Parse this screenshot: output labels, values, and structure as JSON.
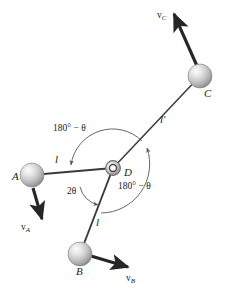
{
  "figure": {
    "width": 227,
    "height": 288,
    "background": "#ffffff",
    "line_color": "#3a3a3a",
    "arc_color": "#555555",
    "arrow_color": "#262626",
    "sphere_fill_light": "#f2f2f2",
    "sphere_fill_mid": "#c9c9c9",
    "sphere_fill_dark": "#8f8f8f",
    "sphere_stroke": "#7a7a7a"
  },
  "nodes": [
    {
      "id": "A",
      "label": "A",
      "cx": 32,
      "cy": 175,
      "r": 12,
      "label_x": 12,
      "label_y": 178,
      "type": "sphere"
    },
    {
      "id": "B",
      "label": "B",
      "cx": 80,
      "cy": 254,
      "r": 12,
      "label_x": 76,
      "label_y": 272,
      "type": "sphere"
    },
    {
      "id": "C",
      "label": "C",
      "cx": 200,
      "cy": 76,
      "r": 12,
      "label_x": 203,
      "label_y": 93,
      "type": "sphere"
    },
    {
      "id": "D",
      "label": "D",
      "cx": 113,
      "cy": 168,
      "r": 6,
      "label_x": 124,
      "label_y": 174,
      "type": "pivot-ring"
    }
  ],
  "rods": [
    {
      "id": "AD",
      "from": "A",
      "to": "D",
      "label": "l",
      "label_x": 56,
      "label_y": 160
    },
    {
      "id": "DB",
      "from": "D",
      "to": "B",
      "label": "l",
      "label_x": 96,
      "label_y": 222
    },
    {
      "id": "DC",
      "from": "D",
      "to": "C",
      "label": "l'",
      "label_x": 161,
      "label_y": 120
    }
  ],
  "velocity_vectors": [
    {
      "id": "vA",
      "symbol": "v",
      "subscript": "A",
      "label": "v_A",
      "x1": 33,
      "y1": 188,
      "x2": 42,
      "y2": 221,
      "label_x": 24,
      "label_y": 229
    },
    {
      "id": "vB",
      "symbol": "v",
      "subscript": "B",
      "label": "v_B",
      "x1": 92,
      "y1": 256,
      "x2": 130,
      "y2": 268,
      "label_x": 127,
      "label_y": 281
    },
    {
      "id": "vC",
      "symbol": "v",
      "subscript": "C",
      "label": "v_C",
      "x1": 196,
      "y1": 65,
      "x2": 172,
      "y2": 11,
      "label_x": 158,
      "label_y": 18
    }
  ],
  "angle_annotations": [
    {
      "id": "angle-upper-left",
      "prefix": "180°",
      "operator": " − ",
      "theta": "θ",
      "text": "180° − θ",
      "label_x": 54,
      "label_y": 130
    },
    {
      "id": "angle-lower-left",
      "prefix": "2",
      "operator": "",
      "theta": "θ",
      "text": "2θ",
      "label_x": 68,
      "label_y": 193
    },
    {
      "id": "angle-lower-right",
      "prefix": "180°",
      "operator": " − ",
      "theta": "θ",
      "text": "180° − θ",
      "label_x": 119,
      "label_y": 188
    }
  ]
}
